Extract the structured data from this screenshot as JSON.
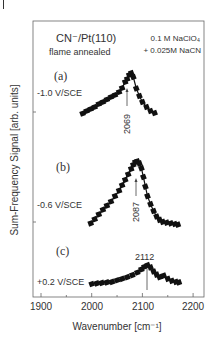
{
  "chart_data": {
    "type": "line",
    "title": "CN⁻/Pt(110) flame annealed",
    "subtitle_lines": [
      "CN⁻/Pt(110)",
      "flame annealed"
    ],
    "condition_lines": [
      "0.1 M NaClO₄",
      "+ 0.025M NaCN"
    ],
    "xlabel": "Wavenumber  [cm⁻¹]",
    "ylabel": "Sum-Frequency Signal  [arb. units]",
    "xlim": [
      1880,
      2225
    ],
    "xticks": [
      1900,
      2000,
      2100,
      2200
    ],
    "xtick_labels": [
      "1900",
      "2000",
      "2100",
      "2200"
    ],
    "grid": false,
    "legend": "none",
    "series": [
      {
        "name": "(a)",
        "panel_label": "(a)",
        "potential": "-1.0 V/SCE",
        "peak_label": "2069",
        "peak_wavenumber": 2069,
        "x": [
          1982,
          1990,
          1998,
          2006,
          2014,
          2022,
          2030,
          2038,
          2046,
          2054,
          2060,
          2066,
          2070,
          2074,
          2078,
          2082,
          2088,
          2094,
          2100,
          2108,
          2116,
          2124
        ],
        "y": [
          0.05,
          0.1,
          0.14,
          0.18,
          0.24,
          0.28,
          0.33,
          0.38,
          0.42,
          0.48,
          0.56,
          0.68,
          0.74,
          0.82,
          0.86,
          0.78,
          0.55,
          0.4,
          0.28,
          0.18,
          0.1,
          0.06
        ]
      },
      {
        "name": "(b)",
        "panel_label": "(b)",
        "potential": "-0.6 V/SCE",
        "peak_label": "2087",
        "peak_wavenumber": 2087,
        "x": [
          1998,
          2006,
          2014,
          2022,
          2030,
          2038,
          2046,
          2054,
          2060,
          2066,
          2072,
          2078,
          2082,
          2086,
          2090,
          2094,
          2098,
          2102,
          2106,
          2110,
          2116,
          2122,
          2128,
          2134,
          2140,
          2148,
          2156,
          2164,
          2170
        ],
        "y": [
          0.04,
          0.1,
          0.17,
          0.24,
          0.3,
          0.36,
          0.44,
          0.52,
          0.6,
          0.68,
          0.76,
          0.84,
          0.9,
          0.94,
          0.95,
          0.92,
          0.85,
          0.72,
          0.58,
          0.44,
          0.32,
          0.22,
          0.14,
          0.09,
          0.06,
          0.05,
          0.04,
          0.03,
          0.02
        ]
      },
      {
        "name": "(c)",
        "panel_label": "(c)",
        "potential": "+0.2 V/SCE",
        "peak_label": "2112",
        "peak_wavenumber": 2112,
        "x": [
          2000,
          2010,
          2020,
          2030,
          2040,
          2050,
          2060,
          2070,
          2080,
          2090,
          2098,
          2104,
          2110,
          2116,
          2122,
          2128,
          2134,
          2142,
          2150,
          2158,
          2166,
          2172
        ],
        "y": [
          0.02,
          0.03,
          0.04,
          0.05,
          0.06,
          0.09,
          0.12,
          0.15,
          0.19,
          0.24,
          0.3,
          0.35,
          0.38,
          0.34,
          0.26,
          0.2,
          0.15,
          0.18,
          0.12,
          0.08,
          0.06,
          0.05
        ]
      }
    ]
  }
}
